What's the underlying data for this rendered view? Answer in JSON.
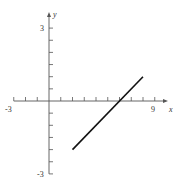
{
  "chart_data": {
    "type": "line",
    "title": "",
    "xlabel": "x",
    "ylabel": "y",
    "xlim": [
      -3,
      9
    ],
    "ylim": [
      -3,
      3
    ],
    "x_tick_step": 1,
    "y_tick_step": 0.5,
    "x_tick_labels": [
      {
        "value": -3,
        "label": "-3"
      },
      {
        "value": 9,
        "label": "9"
      }
    ],
    "y_tick_labels": [
      {
        "value": 3,
        "label": "3"
      },
      {
        "value": -3,
        "label": "-3"
      }
    ],
    "grid": false,
    "legend": null,
    "series": [
      {
        "name": "segment",
        "equation": "y = 0.5x - 3",
        "x": [
          2,
          8
        ],
        "y": [
          -2,
          1
        ],
        "color": "#111111"
      }
    ]
  },
  "labels": {
    "x_axis": "x",
    "y_axis": "y",
    "x_min": "-3",
    "x_max": "9",
    "y_max": "3",
    "y_min": "-3"
  }
}
